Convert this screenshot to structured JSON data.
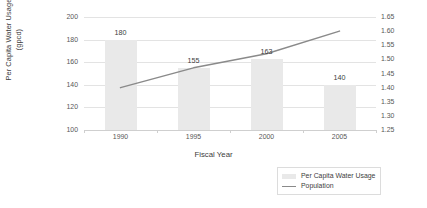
{
  "chart_data": {
    "type": "bar",
    "title": "",
    "xlabel": "Fiscal Year",
    "ylabel": "Per Capita Water Usage (gpcd)",
    "ylabel_line1": "Per Capita Water Usage",
    "ylabel_line2": "(gpcd)",
    "y2label": "",
    "categories": [
      "1990",
      "1995",
      "2000",
      "2005"
    ],
    "ylim": [
      100,
      200
    ],
    "y2lim": [
      1.25,
      1.65
    ],
    "grid": true,
    "legend_position": "bottom-right",
    "series": [
      {
        "name": "Per Capita Water Usage",
        "type": "bar",
        "axis": "left",
        "color": "#e9e9e9",
        "values": [
          180,
          155,
          163,
          140
        ],
        "data_labels": [
          "180",
          "155",
          "163",
          "140"
        ]
      },
      {
        "name": "Population",
        "type": "line",
        "axis": "right",
        "color": "#8a8a8a",
        "values": [
          1.4,
          1.47,
          1.52,
          1.6
        ]
      }
    ],
    "y_left_ticks": [
      "100",
      "120",
      "140",
      "160",
      "180",
      "200"
    ],
    "y_right_ticks": [
      "1.25",
      "1.30",
      "1.35",
      "1.40",
      "1.45",
      "1.50",
      "1.55",
      "1.60",
      "1.65"
    ],
    "x_ticks": [
      "1990",
      "1995",
      "2000",
      "2005"
    ]
  },
  "legend": {
    "items": [
      {
        "label": "Per Capita Water Usage",
        "marker": "bar-swatch"
      },
      {
        "label": "Population",
        "marker": "line-swatch"
      }
    ]
  }
}
